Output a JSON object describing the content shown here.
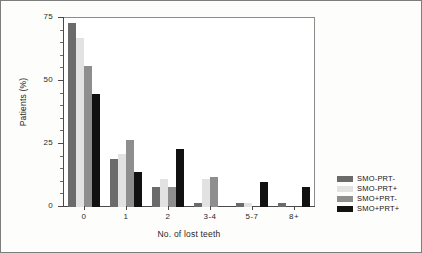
{
  "chart_data": {
    "type": "bar",
    "title": "",
    "xlabel": "No. of lost teeth",
    "ylabel": "Patients (%)",
    "categories": [
      "0",
      "1",
      "2",
      "3-4",
      "5-7",
      "8+"
    ],
    "ylim": [
      0,
      75
    ],
    "yticks": [
      0,
      25,
      50,
      75
    ],
    "ytick_labels": [
      "0",
      "25",
      "50",
      "75"
    ],
    "grid": false,
    "legend_position": "right",
    "series": [
      {
        "name": "SMO-PRT-",
        "color": "#6b6b6b",
        "values": [
          73,
          19,
          8,
          1.5,
          1.5,
          1.5
        ]
      },
      {
        "name": "SMO-PRT+",
        "color": "#e2e2e2",
        "values": [
          67,
          21,
          11,
          11,
          1.5,
          0
        ]
      },
      {
        "name": "SMO+PRT-",
        "color": "#8e8e8e",
        "values": [
          56,
          26.5,
          8,
          12,
          0,
          0
        ]
      },
      {
        "name": "SMO+PRT+",
        "color": "#111111",
        "values": [
          45,
          14,
          23,
          0,
          10,
          8
        ]
      }
    ]
  },
  "legend": {
    "items": [
      {
        "label": "SMO-PRT-",
        "color": "#6b6b6b"
      },
      {
        "label": "SMO-PRT+",
        "color": "#e2e2e2"
      },
      {
        "label": "SMO+PRT-",
        "color": "#8e8e8e"
      },
      {
        "label": "SMO+PRT+",
        "color": "#111111"
      }
    ]
  }
}
